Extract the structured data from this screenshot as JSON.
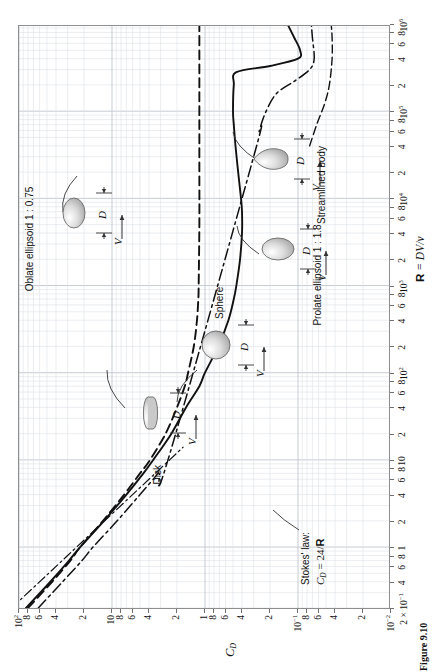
{
  "figure": {
    "caption": "Figure 9.10",
    "x_axis": {
      "title_bold": "R",
      "title_rest": " = DV/ν",
      "range_decades": [
        "2×10⁻¹",
        "10⁶"
      ],
      "tick_labels": [
        {
          "v": 0.2,
          "text": "2 × 10",
          "sup": "−1"
        },
        {
          "v": 0.4,
          "text": "4",
          "sup": ""
        },
        {
          "v": 0.6,
          "text": "6",
          "sup": ""
        },
        {
          "v": 0.8,
          "text": "8",
          "sup": ""
        },
        {
          "v": 1,
          "text": "1",
          "sup": ""
        },
        {
          "v": 2,
          "text": "2",
          "sup": ""
        },
        {
          "v": 4,
          "text": "4",
          "sup": ""
        },
        {
          "v": 6,
          "text": "6",
          "sup": ""
        },
        {
          "v": 8,
          "text": "8",
          "sup": ""
        },
        {
          "v": 10,
          "text": "10",
          "sup": ""
        },
        {
          "v": 20,
          "text": "2",
          "sup": ""
        },
        {
          "v": 40,
          "text": "4",
          "sup": ""
        },
        {
          "v": 60,
          "text": "6",
          "sup": ""
        },
        {
          "v": 80,
          "text": "8",
          "sup": ""
        },
        {
          "v": 100,
          "text": "10",
          "sup": "2"
        },
        {
          "v": 200,
          "text": "2",
          "sup": ""
        },
        {
          "v": 400,
          "text": "4",
          "sup": ""
        },
        {
          "v": 600,
          "text": "6",
          "sup": ""
        },
        {
          "v": 800,
          "text": "8",
          "sup": ""
        },
        {
          "v": 1000,
          "text": "10",
          "sup": "3"
        },
        {
          "v": 2000,
          "text": "2",
          "sup": ""
        },
        {
          "v": 4000,
          "text": "4",
          "sup": ""
        },
        {
          "v": 6000,
          "text": "6",
          "sup": ""
        },
        {
          "v": 8000,
          "text": "8",
          "sup": ""
        },
        {
          "v": 10000,
          "text": "10",
          "sup": "4"
        },
        {
          "v": 20000,
          "text": "2",
          "sup": ""
        },
        {
          "v": 40000,
          "text": "4",
          "sup": ""
        },
        {
          "v": 60000,
          "text": "6",
          "sup": ""
        },
        {
          "v": 80000,
          "text": "8",
          "sup": ""
        },
        {
          "v": 100000,
          "text": "10",
          "sup": "5"
        },
        {
          "v": 200000,
          "text": "2",
          "sup": ""
        },
        {
          "v": 400000,
          "text": "4",
          "sup": ""
        },
        {
          "v": 600000,
          "text": "6",
          "sup": ""
        },
        {
          "v": 800000,
          "text": "8",
          "sup": ""
        },
        {
          "v": 1000000,
          "text": "10",
          "sup": "6"
        }
      ]
    },
    "y_axis": {
      "title": "C",
      "title_sub": "D",
      "tick_labels": [
        {
          "v": 100,
          "text": "10",
          "sup": "2"
        },
        {
          "v": 80,
          "text": "8",
          "sup": ""
        },
        {
          "v": 60,
          "text": "6",
          "sup": ""
        },
        {
          "v": 40,
          "text": "4",
          "sup": ""
        },
        {
          "v": 20,
          "text": "2",
          "sup": ""
        },
        {
          "v": 10,
          "text": "10",
          "sup": ""
        },
        {
          "v": 8,
          "text": "8",
          "sup": ""
        },
        {
          "v": 6,
          "text": "6",
          "sup": ""
        },
        {
          "v": 4,
          "text": "4",
          "sup": ""
        },
        {
          "v": 2,
          "text": "2",
          "sup": ""
        },
        {
          "v": 1,
          "text": "1",
          "sup": ""
        },
        {
          "v": 0.8,
          "text": "8",
          "sup": ""
        },
        {
          "v": 0.6,
          "text": "6",
          "sup": ""
        },
        {
          "v": 0.4,
          "text": "4",
          "sup": ""
        },
        {
          "v": 0.2,
          "text": "2",
          "sup": ""
        },
        {
          "v": 0.1,
          "text": "10",
          "sup": "−1"
        },
        {
          "v": 0.08,
          "text": "8",
          "sup": ""
        },
        {
          "v": 0.06,
          "text": "6",
          "sup": ""
        },
        {
          "v": 0.04,
          "text": "4",
          "sup": ""
        },
        {
          "v": 0.02,
          "text": "2",
          "sup": ""
        },
        {
          "v": 0.01,
          "text": "10",
          "sup": "−2"
        }
      ]
    },
    "annotations": {
      "stokes_line1": "Stokes' law:",
      "stokes_line2_pre": "C",
      "stokes_line2_sub": "D",
      "stokes_line2_mid": " = 24/",
      "stokes_line2_bold": "R",
      "disk": "Disk",
      "sphere": "Sphere",
      "oblate": "Oblate ellipsoid 1 : 0.75",
      "prolate": "Prolate ellipsoid 1 : 1.8",
      "streamlined": "Streamlined body",
      "symbol_D": "D",
      "symbol_V": "V"
    }
  },
  "chart_data": {
    "type": "line",
    "title": "",
    "xlabel": "R = DV/ν",
    "ylabel": "C_D",
    "xscale": "log",
    "yscale": "log",
    "xlim": [
      0.2,
      1000000
    ],
    "ylim": [
      0.01,
      100
    ],
    "grid": true,
    "legend": "inline-annotations",
    "series": [
      {
        "name": "Disk",
        "style": "dashed",
        "points": [
          [
            0.2,
            80
          ],
          [
            0.4,
            44
          ],
          [
            0.7,
            28
          ],
          [
            1.0,
            22
          ],
          [
            2.0,
            12.5
          ],
          [
            4.0,
            7.4
          ],
          [
            7.0,
            5.0
          ],
          [
            10,
            3.9
          ],
          [
            20,
            2.65
          ],
          [
            40,
            2.0
          ],
          [
            70,
            1.65
          ],
          [
            100,
            1.52
          ],
          [
            200,
            1.32
          ],
          [
            400,
            1.22
          ],
          [
            700,
            1.18
          ],
          [
            1000,
            1.17
          ],
          [
            5000,
            1.15
          ],
          [
            20000,
            1.15
          ],
          [
            100000,
            1.15
          ],
          [
            200000,
            1.15
          ],
          [
            300000,
            1.15
          ],
          [
            1000000,
            1.15
          ]
        ]
      },
      {
        "name": "Sphere",
        "style": "solid",
        "points": [
          [
            0.2,
            84
          ],
          [
            0.4,
            46
          ],
          [
            0.7,
            29
          ],
          [
            1.0,
            22
          ],
          [
            2.0,
            12.2
          ],
          [
            4.0,
            7.0
          ],
          [
            7.0,
            4.6
          ],
          [
            10,
            3.6
          ],
          [
            20,
            2.3
          ],
          [
            40,
            1.6
          ],
          [
            70,
            1.15
          ],
          [
            100,
            1.0
          ],
          [
            200,
            0.72
          ],
          [
            400,
            0.56
          ],
          [
            700,
            0.49
          ],
          [
            1000,
            0.46
          ],
          [
            2000,
            0.42
          ],
          [
            4000,
            0.4
          ],
          [
            7000,
            0.4
          ],
          [
            10000,
            0.41
          ],
          [
            20000,
            0.44
          ],
          [
            40000,
            0.47
          ],
          [
            70000,
            0.49
          ],
          [
            100000,
            0.5
          ],
          [
            200000,
            0.49
          ],
          [
            280000,
            0.46
          ],
          [
            330000,
            0.2
          ],
          [
            400000,
            0.1
          ],
          [
            500000,
            0.095
          ],
          [
            700000,
            0.11
          ],
          [
            1000000,
            0.13
          ]
        ]
      },
      {
        "name": "Prolate ellipsoid 1 : 1.8",
        "style": "dash-dot",
        "points": [
          [
            0.2,
            62
          ],
          [
            0.4,
            34
          ],
          [
            0.7,
            21
          ],
          [
            1.0,
            16
          ],
          [
            2.0,
            8.8
          ],
          [
            4.0,
            5.0
          ],
          [
            7.0,
            3.2
          ],
          [
            10,
            2.5
          ],
          [
            30000,
            0.3
          ],
          [
            60000,
            0.26
          ],
          [
            100000,
            0.22
          ],
          [
            160000,
            0.17
          ],
          [
            220000,
            0.11
          ],
          [
            300000,
            0.075
          ],
          [
            400000,
            0.067
          ],
          [
            700000,
            0.07
          ],
          [
            1000000,
            0.072
          ]
        ]
      },
      {
        "name": "Streamlined body",
        "style": "dashed-thin",
        "points": [
          [
            40000,
            0.075
          ],
          [
            70000,
            0.063
          ],
          [
            120000,
            0.052
          ],
          [
            200000,
            0.046
          ],
          [
            400000,
            0.043
          ],
          [
            700000,
            0.043
          ],
          [
            1000000,
            0.044
          ]
        ]
      },
      {
        "name": "Stokes' law: C_D = 24/R",
        "style": "dash-dot-thin",
        "points": [
          [
            0.2,
            120
          ],
          [
            0.5,
            48
          ],
          [
            1.0,
            24
          ],
          [
            2.0,
            12
          ],
          [
            5.0,
            4.8
          ],
          [
            10,
            2.4
          ],
          [
            14,
            1.72
          ]
        ]
      }
    ]
  }
}
